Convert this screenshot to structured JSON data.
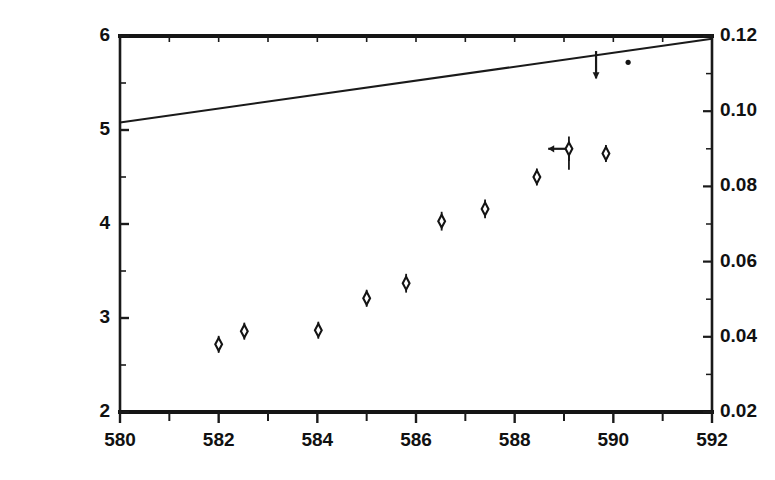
{
  "chart_data": {
    "type": "scatter",
    "title": "",
    "xlabel": "",
    "ylabel": "",
    "xlim": [
      580,
      592
    ],
    "ylim": [
      2,
      6
    ],
    "y2lim": [
      0.02,
      0.12
    ],
    "grid": false,
    "legend": "none",
    "x_ticks": [
      580,
      582,
      584,
      586,
      588,
      590,
      592
    ],
    "x_tick_labels": [
      "580",
      "582",
      "584",
      "586",
      "588",
      "590",
      "592"
    ],
    "x_minor_ticks": [
      581,
      583,
      585,
      587,
      589,
      591
    ],
    "y_ticks": [
      2,
      3,
      4,
      5,
      6
    ],
    "y_tick_labels": [
      "2",
      "3",
      "4",
      "5",
      "6"
    ],
    "y2_ticks": [
      0.02,
      0.04,
      0.06,
      0.08,
      0.1,
      0.12
    ],
    "y2_tick_labels": [
      "0.02",
      "0.04",
      "0.06",
      "0.08",
      "0.10",
      "0.12"
    ],
    "series": [
      {
        "name": "measurements",
        "marker": "diamond",
        "points": [
          {
            "x": 582.0,
            "y": 2.72,
            "yerr": 0.09
          },
          {
            "x": 582.52,
            "y": 2.86,
            "yerr": 0.09
          },
          {
            "x": 584.02,
            "y": 2.87,
            "yerr": 0.09
          },
          {
            "x": 585.0,
            "y": 3.21,
            "yerr": 0.09
          },
          {
            "x": 585.8,
            "y": 3.37,
            "yerr": 0.1
          },
          {
            "x": 586.52,
            "y": 4.03,
            "yerr": 0.1
          },
          {
            "x": 587.4,
            "y": 4.16,
            "yerr": 0.1
          },
          {
            "x": 588.45,
            "y": 4.5,
            "yerr": 0.09
          },
          {
            "x": 589.1,
            "y": 4.8,
            "yerr": 0.13,
            "xarrow": "left",
            "xarrow_len": 0.42
          },
          {
            "x": 589.85,
            "y": 4.75,
            "yerr": 0.09
          }
        ]
      },
      {
        "name": "upper-limit",
        "marker": "down-arrow",
        "points": [
          {
            "x": 589.65,
            "y": 5.84,
            "arrow_to": 5.55
          },
          {
            "x": 590.3,
            "y": 5.72,
            "marker": "dot"
          }
        ]
      },
      {
        "name": "model-line",
        "marker": "line",
        "points": [
          {
            "x": 580.0,
            "y": 5.08
          },
          {
            "x": 592.0,
            "y": 5.97
          }
        ]
      }
    ]
  },
  "frame": {
    "left_px": 120,
    "right_px": 712,
    "top_px": 36,
    "bottom_px": 412
  }
}
